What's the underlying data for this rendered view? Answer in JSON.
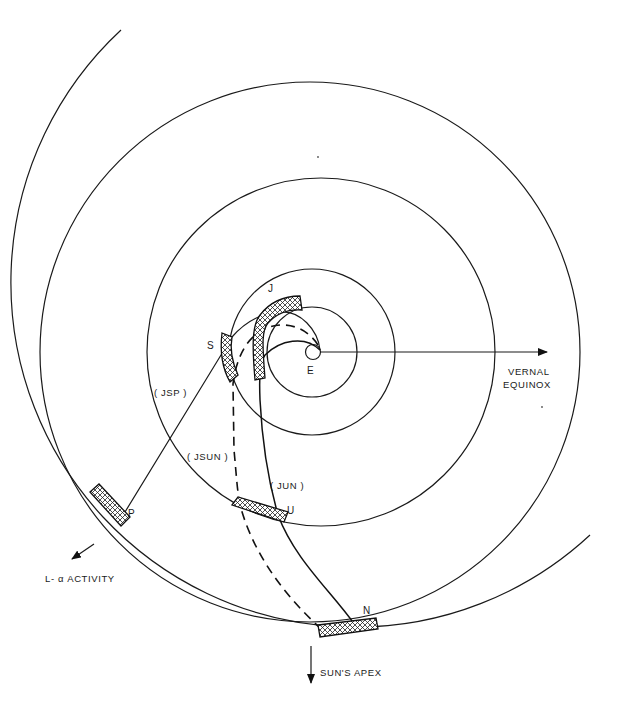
{
  "diagram": {
    "type": "orbital-trajectory-diagram",
    "center_label": "E",
    "stations": [
      {
        "id": "J",
        "label": "J"
      },
      {
        "id": "S",
        "label": "S"
      },
      {
        "id": "P",
        "label": "P"
      },
      {
        "id": "U",
        "label": "U"
      },
      {
        "id": "N",
        "label": "N"
      }
    ],
    "trajectories": [
      {
        "id": "JSP",
        "label": "( JSP )",
        "style": "solid"
      },
      {
        "id": "JSUN",
        "label": "( JSUN )",
        "style": "dashed"
      },
      {
        "id": "JUN",
        "label": "( JUN )",
        "style": "solid"
      }
    ],
    "directions": {
      "vernal_equinox_line1": "VERNAL",
      "vernal_equinox_line2": "EQUINOX",
      "lyman_alpha": "L- α ACTIVITY",
      "suns_apex": "SUN'S APEX"
    },
    "orbit_count": 6,
    "line_color": "#1a1a1a",
    "background": "#ffffff"
  }
}
